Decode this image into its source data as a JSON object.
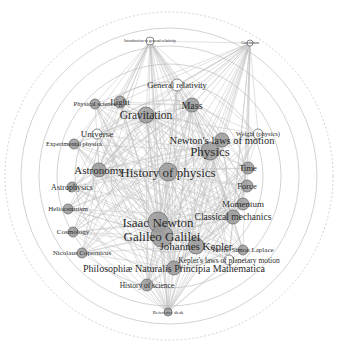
{
  "diagram": {
    "type": "radial-network",
    "center": [
      169,
      176
    ],
    "rings": [
      58,
      76,
      94,
      112,
      130,
      148
    ],
    "outer_ring": 164,
    "ring_color": "#c8c8c8",
    "edge_color": "#bdbdbd",
    "node_fill": "#9a9a9a",
    "node_fill_white": "#ffffff",
    "node_stroke": "#6e6e6e"
  },
  "nodes": [
    {
      "id": "intro_gr",
      "label": "Introduction to general relativity",
      "x": 150,
      "y": 41,
      "r": 4,
      "size": 4,
      "white": true
    },
    {
      "id": "top_right",
      "label": "Gravitation",
      "x": 250,
      "y": 43,
      "r": 3,
      "size": 4,
      "white": true
    },
    {
      "id": "gr",
      "label": "General relativity",
      "x": 177,
      "y": 85,
      "r": 6,
      "size": 8.5,
      "white": true
    },
    {
      "id": "phys_sci",
      "label": "Physical science",
      "x": 95,
      "y": 104,
      "r": 5,
      "size": 6.5
    },
    {
      "id": "light",
      "label": "Light",
      "x": 120,
      "y": 102,
      "r": 6,
      "size": 9
    },
    {
      "id": "mass",
      "label": "Mass",
      "x": 192,
      "y": 105,
      "r": 7,
      "size": 10
    },
    {
      "id": "gravitation",
      "label": "Gravitation",
      "x": 146,
      "y": 115,
      "r": 8,
      "size": 11.5
    },
    {
      "id": "weight",
      "label": "Weight (physics)",
      "x": 258,
      "y": 134,
      "r": 5,
      "size": 6.5,
      "white": true
    },
    {
      "id": "universe",
      "label": "Universe",
      "x": 97,
      "y": 134,
      "r": 5,
      "size": 9,
      "white": true
    },
    {
      "id": "exp_phys",
      "label": "Experimental physics",
      "x": 74,
      "y": 144,
      "r": 5,
      "size": 6.5
    },
    {
      "id": "newton_laws",
      "label": "Newton's laws of motion",
      "x": 222,
      "y": 140,
      "r": 7,
      "size": 10.5
    },
    {
      "id": "physics",
      "label": "Physics",
      "x": 210,
      "y": 151,
      "r": 9,
      "size": 13
    },
    {
      "id": "astronomy",
      "label": "Astronomy",
      "x": 99,
      "y": 170,
      "r": 7,
      "size": 11
    },
    {
      "id": "hist_phys",
      "label": "History of physics",
      "x": 168,
      "y": 172,
      "r": 9,
      "size": 13
    },
    {
      "id": "time",
      "label": "Time",
      "x": 248,
      "y": 168,
      "r": 6,
      "size": 8.5
    },
    {
      "id": "astrophys",
      "label": "Astrophysics",
      "x": 72,
      "y": 187,
      "r": 5,
      "size": 8
    },
    {
      "id": "force",
      "label": "Force",
      "x": 247,
      "y": 186,
      "r": 6,
      "size": 8.5
    },
    {
      "id": "momentum",
      "label": "Momentum",
      "x": 243,
      "y": 204,
      "r": 6,
      "size": 9
    },
    {
      "id": "helio",
      "label": "Heliocentrism",
      "x": 68,
      "y": 209,
      "r": 5,
      "size": 7
    },
    {
      "id": "newton",
      "label": "Isaac Newton",
      "x": 158,
      "y": 222,
      "r": 10,
      "size": 13
    },
    {
      "id": "class_mech",
      "label": "Classical mechanics",
      "x": 233,
      "y": 217,
      "r": 7,
      "size": 9.5
    },
    {
      "id": "cosmology",
      "label": "Cosmology",
      "x": 73,
      "y": 232,
      "r": 5,
      "size": 7
    },
    {
      "id": "galileo",
      "label": "Galileo Galilei",
      "x": 162,
      "y": 236,
      "r": 11,
      "size": 13
    },
    {
      "id": "kepler",
      "label": "Johannes Kepler",
      "x": 196,
      "y": 246,
      "r": 8,
      "size": 11
    },
    {
      "id": "laplace",
      "label": "Pierre-Simon Laplace",
      "x": 243,
      "y": 250,
      "r": 5,
      "size": 7
    },
    {
      "id": "copernicus",
      "label": "Nicolaus Copernicus",
      "x": 82,
      "y": 253,
      "r": 5,
      "size": 7
    },
    {
      "id": "kepler_laws",
      "label": "Kepler's laws of planetary motion",
      "x": 229,
      "y": 260,
      "r": 5,
      "size": 7.5,
      "white": true
    },
    {
      "id": "principia",
      "label": "Philosophiæ Naturalis Principia Mathematica",
      "x": 174,
      "y": 268,
      "r": 7,
      "size": 10
    },
    {
      "id": "hist_sci",
      "label": "History of science",
      "x": 147,
      "y": 285,
      "r": 6,
      "size": 7.5
    },
    {
      "id": "bottom",
      "label": "Reference desk",
      "x": 168,
      "y": 312,
      "r": 4,
      "size": 5
    }
  ],
  "hub_nodes": [
    "hist_phys",
    "newton",
    "galileo",
    "physics",
    "principia",
    "gravitation",
    "astronomy",
    "kepler",
    "mass",
    "class_mech",
    "bottom",
    "intro_gr",
    "top_right"
  ]
}
